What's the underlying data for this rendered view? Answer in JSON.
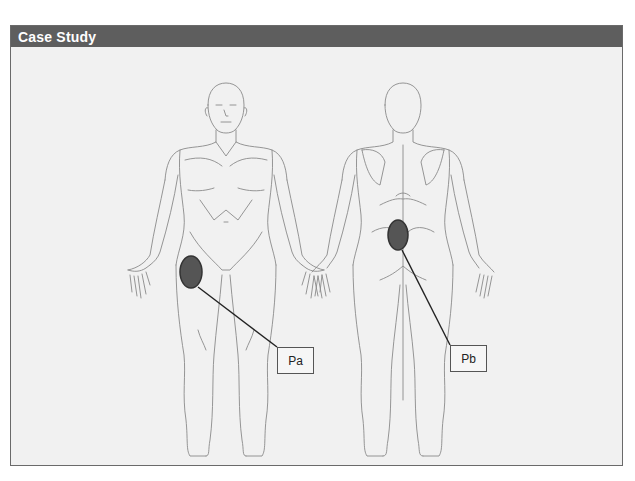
{
  "header": {
    "title": "Case Study"
  },
  "figures": [
    {
      "view": "anterior",
      "marker": {
        "label": "Pa",
        "region": "left anterior upper thigh / hip",
        "color": "#555555"
      }
    },
    {
      "view": "posterior",
      "marker": {
        "label": "Pb",
        "region": "lower back / lumbar",
        "color": "#555555"
      }
    }
  ],
  "colors": {
    "header_bg": "#5e5e5e",
    "panel_bg": "#f1f1f1",
    "outline": "#8a8a8a",
    "marker_fill": "#555555",
    "marker_stroke": "#333333"
  }
}
